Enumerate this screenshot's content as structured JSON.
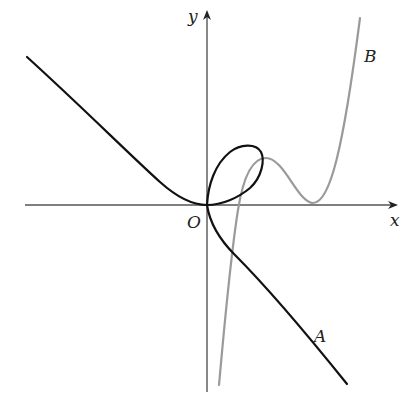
{
  "figure": {
    "axes": {
      "x_label": "x",
      "y_label": "y",
      "origin_label": "O"
    },
    "curves": [
      {
        "id": "A",
        "label": "A",
        "color": "#111111",
        "description": "black curve with loop through origin"
      },
      {
        "id": "B",
        "label": "B",
        "color": "#9a9a9a",
        "description": "gray quartic-like curve touching x-axis"
      }
    ]
  }
}
